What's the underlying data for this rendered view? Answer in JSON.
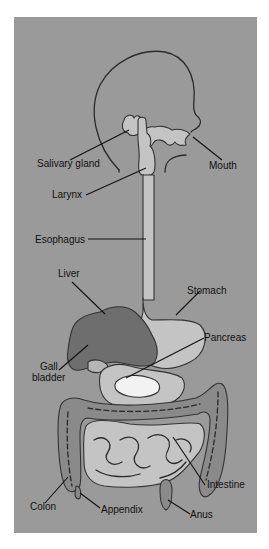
{
  "diagram": {
    "colors": {
      "background": "#9a9a9a",
      "tract_fill": "#c4c4c4",
      "liver_fill": "#6e6e6e",
      "pancreas_fill": "#f2f2f2",
      "outline": "#2a2a2a",
      "label": "#111111"
    },
    "labels": {
      "salivary_gland": "Salivary gland",
      "mouth": "Mouth",
      "larynx": "Larynx",
      "esophagus": "Esophagus",
      "liver": "Liver",
      "stomach": "Stomach",
      "pancreas": "Pancreas",
      "gall_line1": "Gall",
      "gall_line2": "bladder",
      "intestine": "Intestine",
      "colon": "Colon",
      "appendix": "Appendix",
      "anus": "Anus"
    }
  }
}
